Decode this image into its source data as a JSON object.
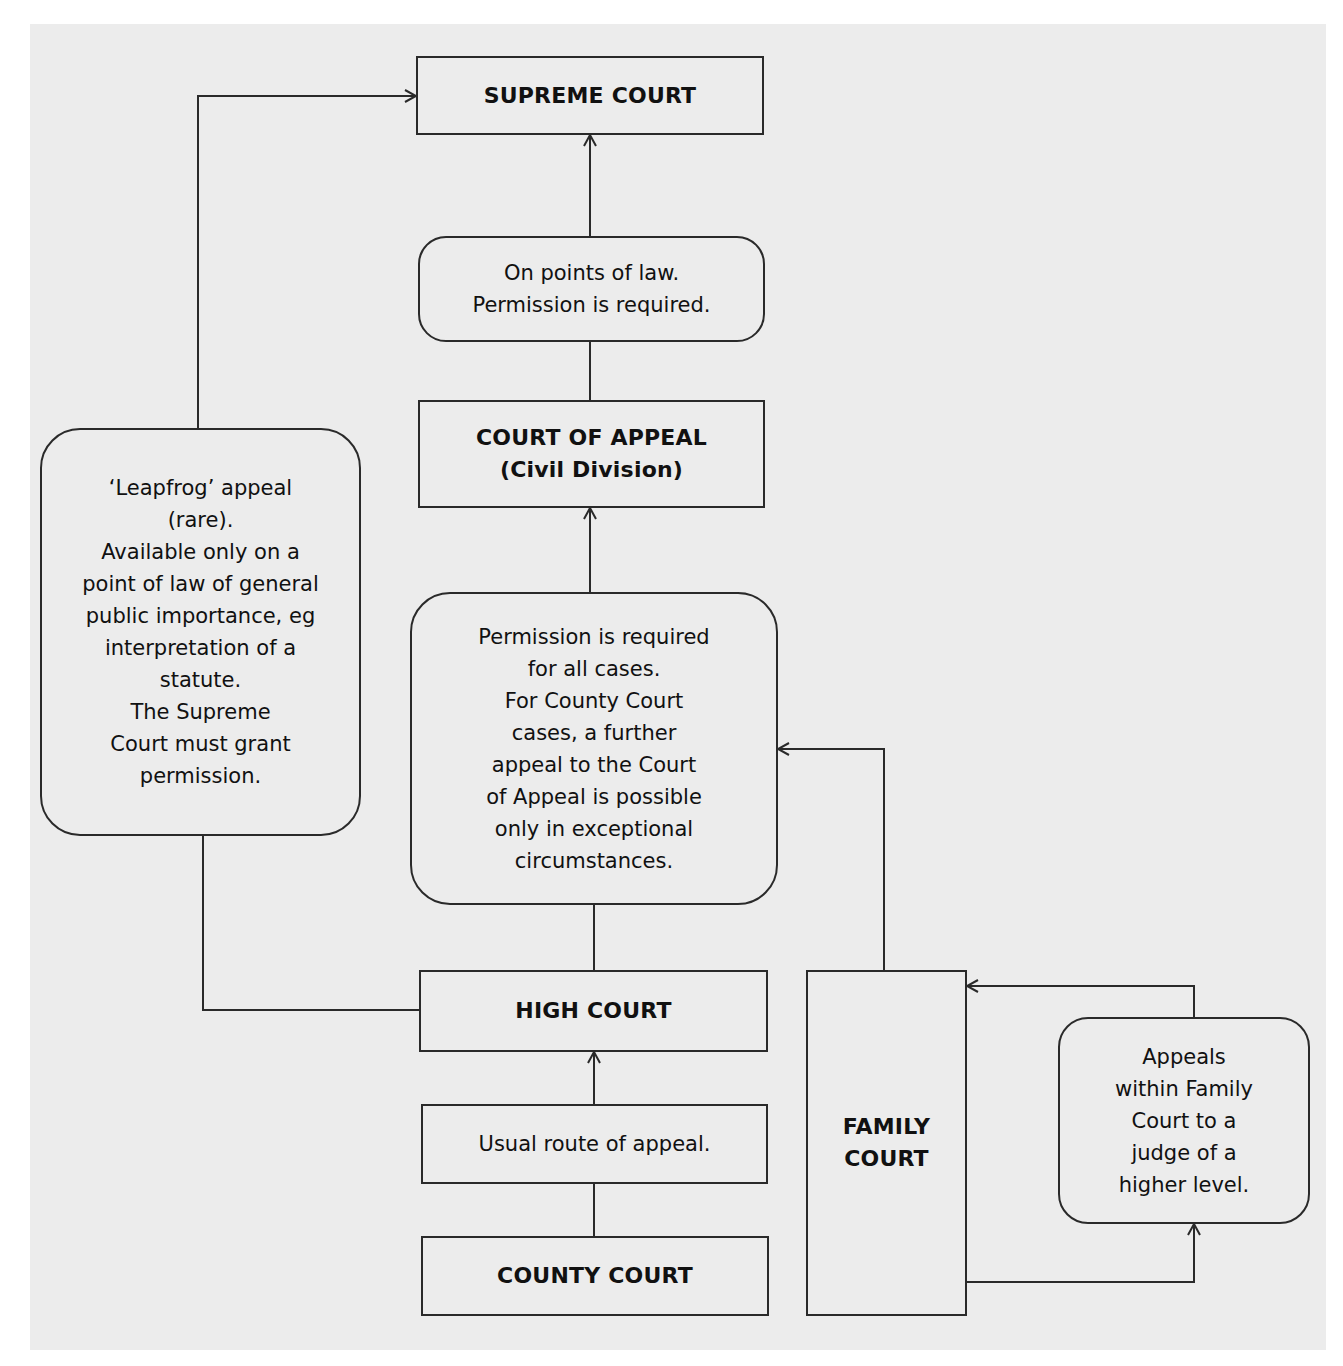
{
  "diagram": {
    "background_color": "#ececec",
    "stroke_color": "#2a2a2a",
    "nodes": {
      "supreme_court": {
        "lines": [
          "SUPREME COURT"
        ]
      },
      "points_of_law": {
        "lines": [
          "On points of law.",
          "Permission is required."
        ]
      },
      "court_of_appeal": {
        "lines": [
          "COURT OF APPEAL",
          "(Civil Division)"
        ]
      },
      "permission_note": {
        "lines": [
          "Permission is required",
          "for all cases.",
          "For County Court",
          "cases, a further",
          "appeal to the Court",
          "of Appeal is possible",
          "only in exceptional",
          "circumstances."
        ]
      },
      "leapfrog": {
        "lines": [
          "‘Leapfrog’ appeal",
          "(rare).",
          "Available only on a",
          "point of law of general",
          "public importance, eg",
          "interpretation of a",
          "statute.",
          "The Supreme",
          "Court must grant",
          "permission."
        ]
      },
      "high_court": {
        "lines": [
          "HIGH COURT"
        ]
      },
      "usual_route": {
        "lines": [
          "Usual route of appeal."
        ]
      },
      "county_court": {
        "lines": [
          "COUNTY COURT"
        ]
      },
      "family_court": {
        "lines": [
          "FAMILY",
          "COURT"
        ]
      },
      "family_appeals": {
        "lines": [
          "Appeals",
          "within Family",
          "Court to a",
          "judge of a",
          "higher level."
        ]
      }
    },
    "edges": [
      {
        "from": "county_court",
        "to": "high_court",
        "via": "usual_route"
      },
      {
        "from": "high_court",
        "to": "court_of_appeal",
        "via": "permission_note"
      },
      {
        "from": "family_court",
        "to": "court_of_appeal",
        "via": "permission_note"
      },
      {
        "from": "court_of_appeal",
        "to": "supreme_court",
        "via": "points_of_law"
      },
      {
        "from": "high_court",
        "to": "supreme_court",
        "via": "leapfrog"
      },
      {
        "from": "family_court",
        "to": "family_court",
        "via": "family_appeals"
      }
    ]
  }
}
